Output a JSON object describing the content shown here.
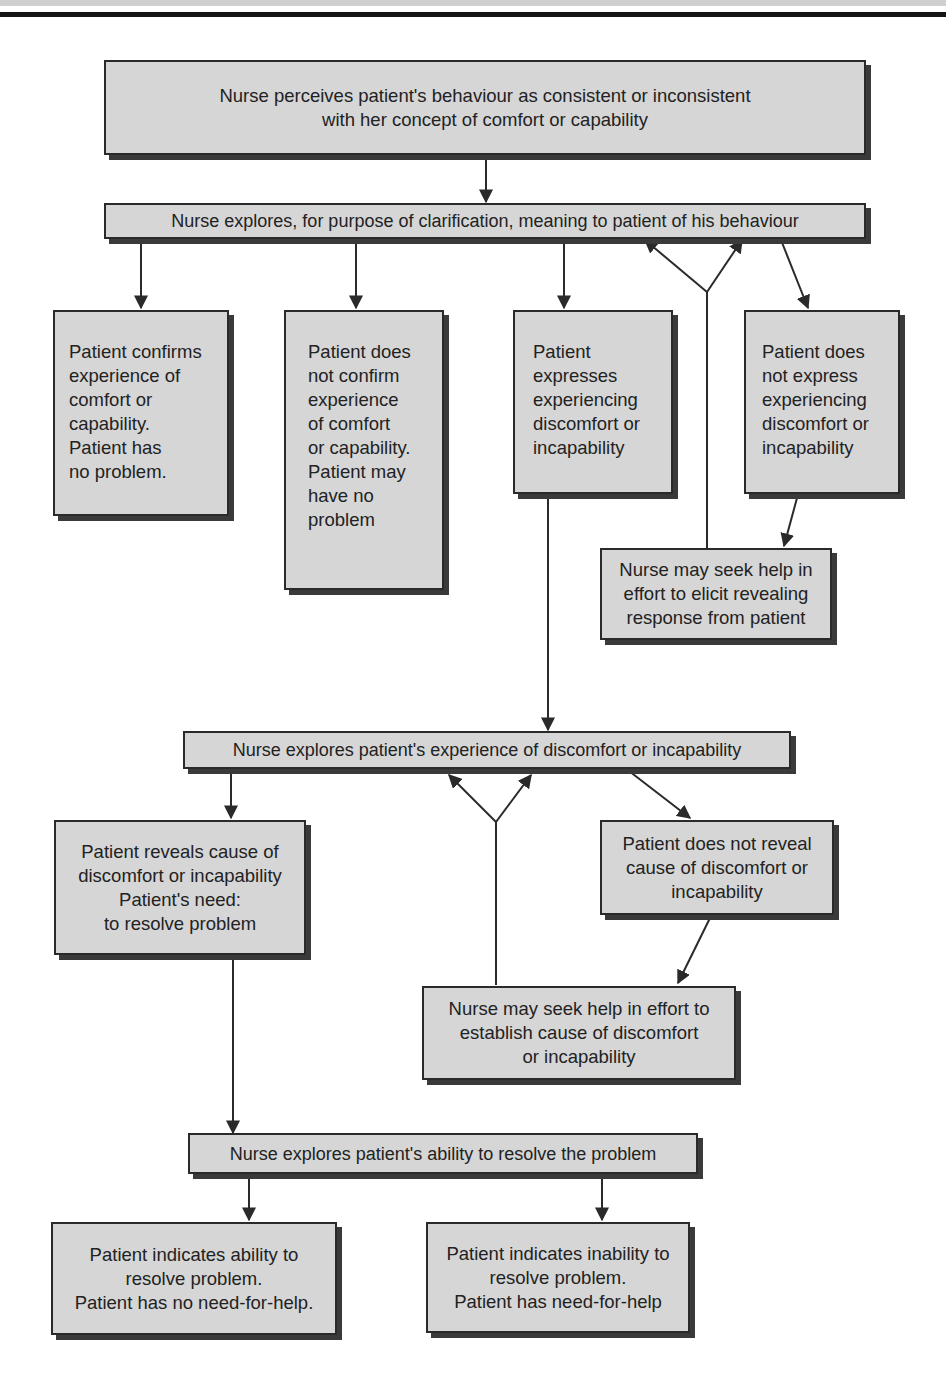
{
  "diagram": {
    "type": "flowchart",
    "nodes": {
      "n1": "Nurse perceives patient's behaviour as consistent or inconsistent\nwith her concept of comfort or capability",
      "n2": "Nurse explores, for purpose of clarification, meaning to patient of his behaviour",
      "n3": "Patient confirms\nexperience of\ncomfort or\ncapability.\nPatient has\nno problem.",
      "n4": "Patient does\nnot confirm\nexperience\nof comfort\nor capability.\nPatient may\nhave no\nproblem",
      "n5": "Patient\nexpresses\nexperiencing\ndiscomfort or\nincapability",
      "n6": "Patient does\nnot express\nexperiencing\ndiscomfort or\nincapability",
      "n7": "Nurse may seek help in\neffort to elicit revealing\nresponse from patient",
      "n8": "Nurse explores patient's experience of discomfort or incapability",
      "n9": "Patient reveals cause of\ndiscomfort or incapability\nPatient's need:\nto resolve problem",
      "n10": "Patient does not reveal\ncause of discomfort or\nincapability",
      "n11": "Nurse may seek help in effort to\nestablish cause of discomfort\nor incapability",
      "n12": "Nurse explores patient's ability to resolve the problem",
      "n13": "Patient indicates ability to\nresolve problem.\nPatient has no need-for-help.",
      "n14": "Patient indicates inability to\nresolve problem.\nPatient has need-for-help"
    },
    "edges": [
      [
        "n1",
        "n2"
      ],
      [
        "n2",
        "n3"
      ],
      [
        "n2",
        "n4"
      ],
      [
        "n2",
        "n5"
      ],
      [
        "n2",
        "n6"
      ],
      [
        "n6",
        "n7"
      ],
      [
        "n7",
        "n2"
      ],
      [
        "n5",
        "n8"
      ],
      [
        "n8",
        "n9"
      ],
      [
        "n8",
        "n10"
      ],
      [
        "n10",
        "n11"
      ],
      [
        "n11",
        "n8"
      ],
      [
        "n9",
        "n12"
      ],
      [
        "n12",
        "n13"
      ],
      [
        "n12",
        "n14"
      ]
    ]
  }
}
